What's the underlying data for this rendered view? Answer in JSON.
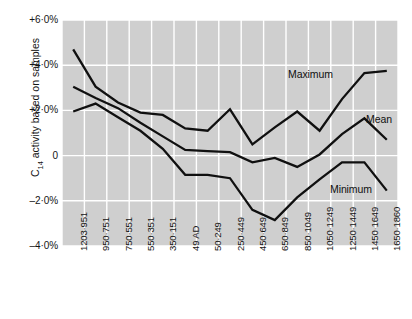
{
  "figure": {
    "background_color": "#ffffff",
    "plot_background_color": "#cfcfcf",
    "gridline_color": "#ffffff",
    "line_color": "#101010"
  },
  "axis": {
    "y_title": "C",
    "y_title_sub": "14",
    "y_title_rest": " activity based on samples",
    "y_ticks": [
      "+6·0%",
      "+4·0%",
      "+2·0%",
      "0",
      "–2·0%",
      "–4·0%"
    ],
    "y_tick_values": [
      6.0,
      4.0,
      2.0,
      0.0,
      -2.0,
      -4.0
    ],
    "x_ticks": [
      "1203·951",
      "950·751",
      "750·551",
      "550·351",
      "350·151",
      "49 AD",
      "50·249",
      "250·449",
      "450·649",
      "650·849",
      "850·1049",
      "1050·1249",
      "1250·1449",
      "1450·1649",
      "1650·1860"
    ]
  },
  "annotations": {
    "maximum": "Maximum",
    "mean": "Mean",
    "minimum": "Minimum"
  },
  "chart_data": {
    "type": "line",
    "title": "",
    "xlabel": "",
    "ylabel": "C14 activity based on samples",
    "ylim": [
      -4.0,
      6.0
    ],
    "grid": true,
    "legend_position": "inline-labels",
    "categories": [
      "1203-951",
      "950-751",
      "750-551",
      "550-351",
      "350-151",
      "49 AD",
      "50-249",
      "250-449",
      "450-649",
      "650-849",
      "850-1049",
      "1050-1249",
      "1250-1449",
      "1450-1649",
      "1650-1860"
    ],
    "series": [
      {
        "name": "Maximum",
        "color": "#101010",
        "values": [
          4.7,
          3.05,
          2.35,
          1.9,
          1.8,
          1.2,
          1.1,
          2.05,
          0.5,
          1.25,
          1.95,
          1.1,
          2.5,
          3.65,
          3.75
        ]
      },
      {
        "name": "Mean",
        "color": "#101010",
        "values": [
          3.05,
          2.55,
          2.1,
          1.45,
          0.85,
          0.25,
          0.2,
          0.15,
          -0.3,
          -0.1,
          -0.5,
          0.05,
          0.95,
          1.65,
          0.7
        ]
      },
      {
        "name": "Minimum",
        "color": "#101010",
        "values": [
          1.95,
          2.3,
          1.7,
          1.1,
          0.3,
          -0.85,
          -0.85,
          -1.0,
          -2.4,
          -2.85,
          -1.85,
          -1.05,
          -0.3,
          -0.3,
          -1.55
        ]
      }
    ]
  }
}
